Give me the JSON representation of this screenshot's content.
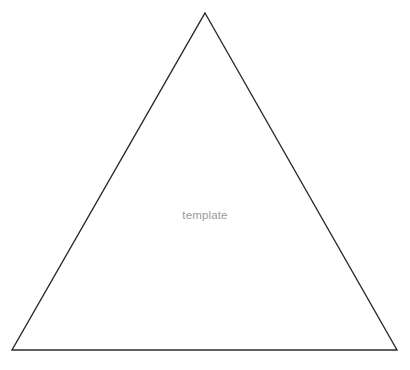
{
  "canvas": {
    "width": 410,
    "height": 370,
    "background_color": "#ffffff"
  },
  "diagram": {
    "type": "triangle-outline",
    "label": "template",
    "label_color": "#9a9a9a",
    "stroke_color": "#2b2b2b",
    "stroke_width": 1.4,
    "fill": "none",
    "vertices": {
      "apex": {
        "x": 205,
        "y": 13
      },
      "bottom_left": {
        "x": 12,
        "y": 350
      },
      "bottom_right": {
        "x": 397,
        "y": 350
      }
    },
    "points_attr": "205,13 397,350 12,350",
    "label_position": {
      "x": 205,
      "y": 218
    }
  }
}
